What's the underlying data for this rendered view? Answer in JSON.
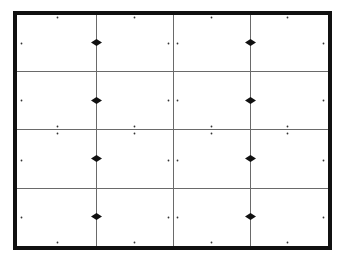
{
  "diagram": {
    "type": "grid-layout-with-markers",
    "canvas": {
      "width": 339,
      "height": 258,
      "background": "#ffffff"
    },
    "frame": {
      "x1": 13,
      "y1": 11,
      "x2": 332,
      "y2": 250,
      "thickness": 4,
      "color": "#111111"
    },
    "grid": {
      "columns": 4,
      "rows": 4,
      "vertical_lines_x": [
        96,
        173,
        250
      ],
      "horizontal_lines_y": [
        71,
        129,
        188
      ],
      "line_color": "#6a6a6a",
      "line_width": 1
    },
    "diamonds": {
      "color": "#111111",
      "width": 11,
      "height": 7,
      "points": [
        {
          "x": 96,
          "y": 42
        },
        {
          "x": 96,
          "y": 100
        },
        {
          "x": 96,
          "y": 158
        },
        {
          "x": 96,
          "y": 216
        },
        {
          "x": 250,
          "y": 42
        },
        {
          "x": 250,
          "y": 100
        },
        {
          "x": 250,
          "y": 158
        },
        {
          "x": 250,
          "y": 216
        }
      ]
    },
    "dots": {
      "color": "#333333",
      "radius": 0.9,
      "points": [
        {
          "x": 57,
          "y": 17
        },
        {
          "x": 134,
          "y": 17
        },
        {
          "x": 211,
          "y": 17
        },
        {
          "x": 287,
          "y": 17
        },
        {
          "x": 57,
          "y": 242
        },
        {
          "x": 134,
          "y": 242
        },
        {
          "x": 211,
          "y": 242
        },
        {
          "x": 287,
          "y": 242
        },
        {
          "x": 21,
          "y": 43
        },
        {
          "x": 21,
          "y": 100
        },
        {
          "x": 21,
          "y": 160
        },
        {
          "x": 21,
          "y": 217
        },
        {
          "x": 323,
          "y": 43
        },
        {
          "x": 323,
          "y": 100
        },
        {
          "x": 323,
          "y": 160
        },
        {
          "x": 323,
          "y": 217
        },
        {
          "x": 168,
          "y": 43
        },
        {
          "x": 177,
          "y": 43
        },
        {
          "x": 168,
          "y": 100
        },
        {
          "x": 177,
          "y": 100
        },
        {
          "x": 168,
          "y": 160
        },
        {
          "x": 177,
          "y": 160
        },
        {
          "x": 168,
          "y": 217
        },
        {
          "x": 177,
          "y": 217
        },
        {
          "x": 57,
          "y": 126
        },
        {
          "x": 134,
          "y": 126
        },
        {
          "x": 211,
          "y": 126
        },
        {
          "x": 287,
          "y": 126
        },
        {
          "x": 57,
          "y": 133
        },
        {
          "x": 134,
          "y": 133
        },
        {
          "x": 211,
          "y": 133
        },
        {
          "x": 287,
          "y": 133
        }
      ]
    }
  }
}
